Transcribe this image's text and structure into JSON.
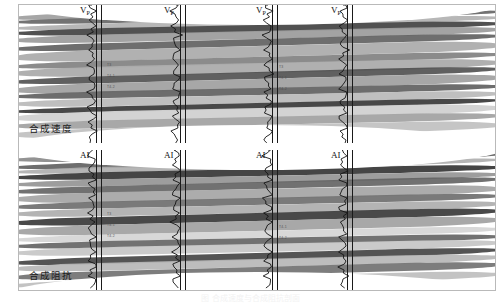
{
  "figure": {
    "caption": "图 合成速度与合成阻抗剖面",
    "panels": [
      {
        "id": "velocity",
        "caption": "合成速度",
        "well_label": "V",
        "well_label_sub": "P",
        "wells": [
          {
            "name": "well-1",
            "x": 96
          },
          {
            "name": "well-2",
            "x": 180
          },
          {
            "name": "well-3",
            "x": 272
          },
          {
            "name": "well-4",
            "x": 347
          }
        ],
        "horizon_tags": [
          "T3",
          "T4-1",
          "T4-2"
        ]
      },
      {
        "id": "impedance",
        "caption": "合成阻抗",
        "well_label": "AI",
        "well_label_sub": "",
        "wells": [
          {
            "name": "well-1",
            "x": 96
          },
          {
            "name": "well-2",
            "x": 180
          },
          {
            "name": "well-3",
            "x": 272
          },
          {
            "name": "well-4",
            "x": 347
          }
        ],
        "horizon_tags": [
          "T3",
          "T4-1",
          "T4-2"
        ]
      }
    ]
  },
  "chart_data": {
    "type": "heatmap",
    "subtitle": "",
    "xlabel": "",
    "ylabel": "",
    "colormap": "grayscale",
    "legend": [],
    "grid": false,
    "panels": [
      {
        "name": "合成速度",
        "label_symbol": "Vp",
        "well_count": 4,
        "well_positions_px": [
          96,
          180,
          272,
          347
        ],
        "layer_bands": [
          {
            "top_pct": 2,
            "height_pct": 5,
            "gray": "#9a9a9a"
          },
          {
            "top_pct": 7,
            "height_pct": 4,
            "gray": "#6e6e6e"
          },
          {
            "top_pct": 11,
            "height_pct": 4,
            "gray": "#b4b4b4"
          },
          {
            "top_pct": 15,
            "height_pct": 5,
            "gray": "#4f4f4f"
          },
          {
            "top_pct": 20,
            "height_pct": 6,
            "gray": "#9e9e9e"
          },
          {
            "top_pct": 26,
            "height_pct": 5,
            "gray": "#5c5c5c"
          },
          {
            "top_pct": 31,
            "height_pct": 8,
            "gray": "#a8a8a8"
          },
          {
            "top_pct": 39,
            "height_pct": 5,
            "gray": "#808080"
          },
          {
            "top_pct": 44,
            "height_pct": 7,
            "gray": "#adadad"
          },
          {
            "top_pct": 51,
            "height_pct": 5,
            "gray": "#4a4a4a"
          },
          {
            "top_pct": 56,
            "height_pct": 7,
            "gray": "#9c9c9c"
          },
          {
            "top_pct": 63,
            "height_pct": 5,
            "gray": "#6a6a6a"
          },
          {
            "top_pct": 68,
            "height_pct": 6,
            "gray": "#bdbdbd"
          },
          {
            "top_pct": 74,
            "height_pct": 4,
            "gray": "#3d3d3d"
          },
          {
            "top_pct": 78,
            "height_pct": 7,
            "gray": "#d2d2d2"
          },
          {
            "top_pct": 85,
            "height_pct": 6,
            "gray": "#a5a5a5"
          },
          {
            "top_pct": 91,
            "height_pct": 7,
            "gray": "#c4c4c4"
          }
        ]
      },
      {
        "name": "合成阻抗",
        "label_symbol": "AI",
        "well_count": 4,
        "well_positions_px": [
          96,
          180,
          272,
          347
        ],
        "layer_bands": [
          {
            "top_pct": 1,
            "height_pct": 5,
            "gray": "#8f8f8f"
          },
          {
            "top_pct": 6,
            "height_pct": 4,
            "gray": "#5a5a5a"
          },
          {
            "top_pct": 10,
            "height_pct": 4,
            "gray": "#aeaeae"
          },
          {
            "top_pct": 14,
            "height_pct": 5,
            "gray": "#3f3f3f"
          },
          {
            "top_pct": 19,
            "height_pct": 5,
            "gray": "#9b9b9b"
          },
          {
            "top_pct": 24,
            "height_pct": 5,
            "gray": "#626262"
          },
          {
            "top_pct": 29,
            "height_pct": 7,
            "gray": "#a9a9a9"
          },
          {
            "top_pct": 36,
            "height_pct": 5,
            "gray": "#737373"
          },
          {
            "top_pct": 41,
            "height_pct": 6,
            "gray": "#b2b2b2"
          },
          {
            "top_pct": 47,
            "height_pct": 6,
            "gray": "#3a3a3a"
          },
          {
            "top_pct": 53,
            "height_pct": 7,
            "gray": "#9f9f9f"
          },
          {
            "top_pct": 60,
            "height_pct": 5,
            "gray": "#d6d6d6"
          },
          {
            "top_pct": 65,
            "height_pct": 5,
            "gray": "#707070"
          },
          {
            "top_pct": 70,
            "height_pct": 6,
            "gray": "#c9c9c9"
          },
          {
            "top_pct": 76,
            "height_pct": 5,
            "gray": "#3c3c3c"
          },
          {
            "top_pct": 81,
            "height_pct": 6,
            "gray": "#b8b8b8"
          },
          {
            "top_pct": 87,
            "height_pct": 6,
            "gray": "#6d6d6d"
          },
          {
            "top_pct": 93,
            "height_pct": 6,
            "gray": "#bfbfbf"
          }
        ]
      }
    ]
  }
}
